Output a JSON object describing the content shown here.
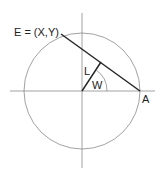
{
  "diagram": {
    "labels": {
      "point_e": "E = (X,Y)",
      "segment_l": "L",
      "angle_w": "W",
      "point_a": "A"
    },
    "colors": {
      "circle": "#8a8a8a",
      "axes": "#8a8a8a",
      "chord": "#222222",
      "text": "#222222"
    }
  }
}
